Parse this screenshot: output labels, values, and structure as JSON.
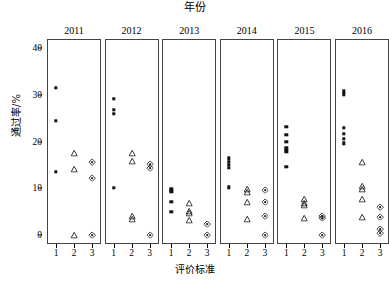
{
  "chart_data": {
    "type": "scatter",
    "title": "年份",
    "xlabel": "评价标准",
    "ylabel": "通过率/%",
    "ylim": [
      -2,
      42
    ],
    "yticks": [
      0,
      10,
      20,
      30,
      40
    ],
    "ytick_labels": [
      "0",
      "10",
      "20",
      "30",
      "40"
    ],
    "xcategories": [
      "1",
      "2",
      "3"
    ],
    "grid": false,
    "legend": "none",
    "facet_variable": "年份",
    "facets": [
      {
        "label": "2011",
        "series": [
          {
            "name": "1",
            "marker": "square",
            "values": [
              31.5,
              24.5,
              13.5
            ]
          },
          {
            "name": "2",
            "marker": "triangle",
            "values": [
              17.5,
              14.0,
              0.0
            ]
          },
          {
            "name": "3",
            "marker": "diamond",
            "values": [
              15.6,
              12.2,
              0.0
            ]
          }
        ]
      },
      {
        "label": "2012",
        "series": [
          {
            "name": "1",
            "marker": "square",
            "values": [
              29.2,
              26.8,
              25.9,
              10.1
            ]
          },
          {
            "name": "2",
            "marker": "triangle",
            "values": [
              17.5,
              15.9,
              4.1,
              3.4
            ]
          },
          {
            "name": "3",
            "marker": "diamond",
            "values": [
              15.2,
              14.4,
              0.0
            ]
          }
        ]
      },
      {
        "label": "2013",
        "series": [
          {
            "name": "1",
            "marker": "square",
            "values": [
              9.7,
              9.3,
              7.1,
              4.9
            ]
          },
          {
            "name": "2",
            "marker": "triangle",
            "values": [
              6.8,
              5.1,
              4.7,
              3.2
            ]
          },
          {
            "name": "3",
            "marker": "diamond",
            "values": [
              2.4,
              0.0
            ]
          }
        ]
      },
      {
        "label": "2014",
        "series": [
          {
            "name": "1",
            "marker": "square",
            "values": [
              16.4,
              15.6,
              15.0,
              14.4,
              10.2
            ]
          },
          {
            "name": "2",
            "marker": "triangle",
            "values": [
              9.7,
              9.2,
              7.1,
              3.4
            ]
          },
          {
            "name": "3",
            "marker": "diamond",
            "values": [
              9.6,
              7.1,
              4.1,
              0.0
            ]
          }
        ]
      },
      {
        "label": "2015",
        "series": [
          {
            "name": "1",
            "marker": "square",
            "values": [
              23.2,
              21.5,
              20.0,
              18.5,
              17.9,
              14.6
            ]
          },
          {
            "name": "2",
            "marker": "triangle",
            "values": [
              7.6,
              6.9,
              6.4,
              3.6
            ]
          },
          {
            "name": "3",
            "marker": "diamond",
            "values": [
              4.0,
              3.6,
              0.0
            ]
          }
        ]
      },
      {
        "label": "2016",
        "series": [
          {
            "name": "1",
            "marker": "square",
            "values": [
              30.8,
              30.1,
              23.0,
              21.6,
              20.6,
              19.6
            ]
          },
          {
            "name": "2",
            "marker": "triangle",
            "values": [
              15.5,
              10.4,
              9.9,
              7.6,
              3.9
            ]
          },
          {
            "name": "3",
            "marker": "diamond",
            "values": [
              5.9,
              3.8,
              1.3,
              0.3
            ]
          }
        ]
      }
    ]
  }
}
